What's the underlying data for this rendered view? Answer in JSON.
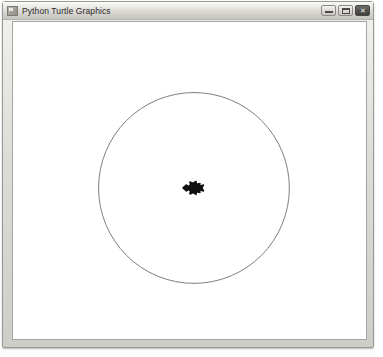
{
  "window": {
    "title": "Python Turtle Graphics",
    "icon": "turtle-app-icon",
    "buttons": {
      "minimize": {
        "label": "Minimize",
        "glyph": ""
      },
      "maximize": {
        "label": "Maximize",
        "glyph": ""
      },
      "close": {
        "label": "Close",
        "glyph": "✕"
      }
    }
  },
  "canvas": {
    "background_color": "#ffffff",
    "border_color": "#a6a4a0",
    "width": 355,
    "height": 319,
    "drawing": {
      "description": "A turtle graphics drawing: a single thin circle traced around the center with the turtle cursor resting at the center.",
      "shapes": [
        {
          "type": "circle",
          "name": "traced-circle",
          "center_x": 182,
          "center_y": 167,
          "radius": 96,
          "stroke_color": "#7d7d7d",
          "stroke_width": 1,
          "fill": "none"
        },
        {
          "type": "turtle-cursor",
          "name": "turtle-cursor",
          "center_x": 182,
          "center_y": 167,
          "heading_degrees": 180,
          "fill_color": "#111111",
          "width": 22,
          "height": 19
        }
      ]
    }
  }
}
